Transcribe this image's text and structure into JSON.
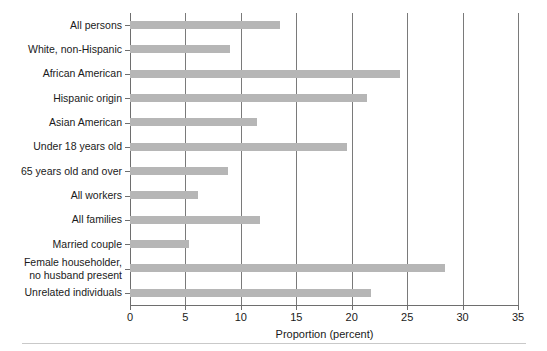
{
  "chart_data": {
    "type": "bar",
    "orientation": "horizontal",
    "title": "",
    "xlabel": "Proportion (percent)",
    "ylabel": "",
    "xlim": [
      0,
      35
    ],
    "xticks": [
      0,
      5,
      10,
      15,
      20,
      25,
      30,
      35
    ],
    "xtick_labels": [
      "0",
      "5",
      "10",
      "15",
      "20",
      "25",
      "30",
      "35"
    ],
    "grid": "vertical",
    "legend": "none",
    "bar_color": "#b6b6b6",
    "axis_color": "#6e6e6e",
    "gridline_color": "#7a7a7a",
    "categories": [
      "All persons",
      "White, non-Hispanic",
      "African American",
      "Hispanic origin",
      "Asian American",
      "Under 18 years old",
      "65 years old and over",
      "All workers",
      "All families",
      "Married couple",
      "Female householder,\nno husband present",
      "Unrelated individuals"
    ],
    "values": [
      13.5,
      9.0,
      24.4,
      21.4,
      11.5,
      19.6,
      8.8,
      6.1,
      11.7,
      5.3,
      28.4,
      21.7
    ]
  }
}
